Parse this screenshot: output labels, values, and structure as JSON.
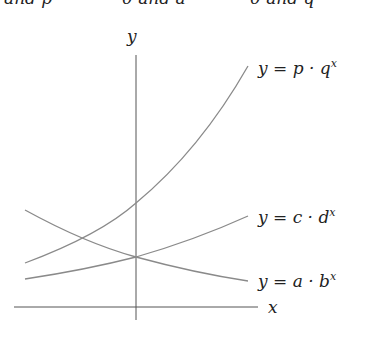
{
  "header_clipped": {
    "fragments": [
      "and p",
      "0 and a",
      "0 and q"
    ]
  },
  "axes": {
    "x_label": "x",
    "y_label": "y",
    "color": "#555555"
  },
  "curves": [
    {
      "name": "p-q",
      "label_prefix": "y = p · q",
      "exponent": "x",
      "color": "#8a8a8a",
      "trend": "increasing-steep"
    },
    {
      "name": "c-d",
      "label_prefix": "y = c · d",
      "exponent": "x",
      "color": "#8a8a8a",
      "trend": "increasing"
    },
    {
      "name": "a-b",
      "label_prefix": "y = a · b",
      "exponent": "x",
      "color": "#8a8a8a",
      "trend": "decreasing"
    }
  ]
}
